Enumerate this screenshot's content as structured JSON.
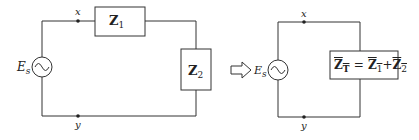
{
  "left_circuit": {
    "source_label": "E",
    "source_subscript": "s",
    "node_top": "x",
    "node_bottom": "y",
    "z1_label": "Z",
    "z1_subscript": "1",
    "z2_label": "Z",
    "z2_subscript": "2"
  },
  "right_circuit": {
    "source_label": "E",
    "source_subscript": "s",
    "node_top": "x",
    "node_bottom": "y",
    "equation": {
      "lhs": "Z",
      "lhs_subscript": "T",
      "equals": "=",
      "t1": "Z",
      "t1_subscript": "1",
      "plus": "+",
      "t2": "Z",
      "t2_subscript": "2"
    }
  },
  "colors": {
    "line": "#333333",
    "background": "#ffffff"
  }
}
